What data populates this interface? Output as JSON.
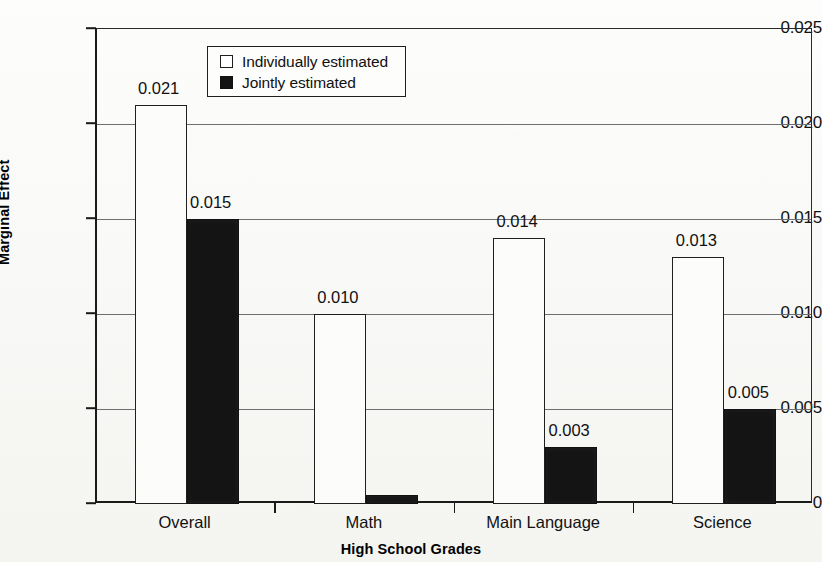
{
  "chart_data": {
    "type": "bar",
    "title": "",
    "xlabel": "High School Grades",
    "ylabel": "Marginal Effect",
    "ylim": [
      0,
      0.025
    ],
    "grid": true,
    "legend_position": "top-left-inside",
    "categories": [
      "Overall",
      "Math",
      "Main Language",
      "Science"
    ],
    "ytick_labels": [
      "0",
      "0.005",
      "0.010",
      "0.015",
      "0.020",
      "0.025"
    ],
    "ytick_values": [
      0,
      0.005,
      0.01,
      0.015,
      0.02,
      0.025
    ],
    "series": [
      {
        "name": "Individually estimated",
        "color": "#ffffff",
        "values": [
          0.021,
          0.01,
          0.014,
          0.013
        ],
        "labels": [
          "0.021",
          "0.010",
          "0.014",
          "0.013"
        ]
      },
      {
        "name": "Jointly estimated",
        "color": "#141414",
        "values": [
          0.015,
          0.0005,
          0.003,
          0.005
        ],
        "labels": [
          "0.015",
          "",
          "0.003",
          "0.005"
        ]
      }
    ]
  },
  "legend": {
    "items": [
      {
        "label": "Individually estimated",
        "swatch": "white-square"
      },
      {
        "label": "Jointly estimated",
        "swatch": "black-square"
      }
    ]
  },
  "axes": {
    "y_title": "Marginal Effect",
    "x_title": "High School Grades"
  }
}
